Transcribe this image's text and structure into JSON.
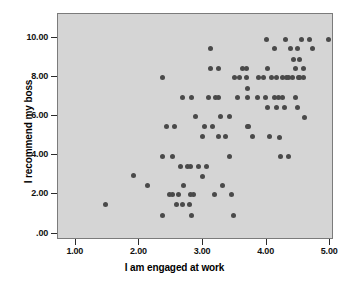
{
  "chart_data": {
    "type": "scatter",
    "title": "",
    "xlabel": "I am engaged at work",
    "ylabel": "I recommend my boss",
    "xlim": [
      0.72,
      5.06
    ],
    "ylim": [
      -0.32,
      11.2
    ],
    "grid": false,
    "legend": "none",
    "xticks": [
      "1.00",
      "2.00",
      "3.00",
      "4.00",
      "5.00"
    ],
    "xtick_values": [
      1.0,
      2.0,
      3.0,
      4.0,
      5.0
    ],
    "yticks": [
      "10.00",
      "8.00",
      "6.00",
      "4.00",
      "2.00",
      ".00"
    ],
    "ytick_values": [
      10.0,
      8.0,
      6.0,
      4.0,
      2.0,
      0.0
    ],
    "marker": "circle",
    "marker_color": "#4a4a4a",
    "plot_background": "#d5d5d5",
    "figure_background": "#ffffff",
    "n_points": 97,
    "points": [
      [
        1.47,
        1.5
      ],
      [
        1.9,
        2.95
      ],
      [
        2.12,
        2.45
      ],
      [
        2.37,
        7.95
      ],
      [
        2.37,
        3.95
      ],
      [
        2.37,
        0.95
      ],
      [
        2.42,
        5.45
      ],
      [
        2.52,
        3.95
      ],
      [
        2.52,
        1.98
      ],
      [
        2.55,
        5.45
      ],
      [
        2.62,
        1.98
      ],
      [
        2.65,
        3.45
      ],
      [
        2.67,
        6.95
      ],
      [
        2.68,
        1.47
      ],
      [
        2.7,
        2.45
      ],
      [
        2.75,
        3.45
      ],
      [
        2.78,
        1.47
      ],
      [
        2.8,
        3.45
      ],
      [
        2.8,
        1.98
      ],
      [
        2.82,
        6.95
      ],
      [
        2.82,
        0.95
      ],
      [
        2.88,
        5.95
      ],
      [
        3.0,
        4.95
      ],
      [
        3.02,
        5.45
      ],
      [
        3.0,
        2.93
      ],
      [
        3.05,
        3.45
      ],
      [
        3.12,
        9.45
      ],
      [
        3.12,
        8.4
      ],
      [
        3.15,
        5.45
      ],
      [
        3.18,
        1.98
      ],
      [
        3.25,
        8.4
      ],
      [
        3.25,
        6.95
      ],
      [
        3.25,
        4.95
      ],
      [
        3.28,
        5.95
      ],
      [
        3.3,
        2.45
      ],
      [
        3.42,
        5.95
      ],
      [
        3.42,
        3.95
      ],
      [
        3.45,
        1.98
      ],
      [
        3.48,
        0.95
      ],
      [
        3.5,
        7.95
      ],
      [
        3.55,
        6.95
      ],
      [
        3.68,
        8.4
      ],
      [
        3.68,
        7.95
      ],
      [
        3.7,
        7.42
      ],
      [
        3.7,
        6.95
      ],
      [
        3.7,
        5.45
      ],
      [
        3.72,
        5.45
      ],
      [
        3.78,
        4.95
      ],
      [
        3.95,
        7.95
      ],
      [
        3.98,
        6.95
      ],
      [
        4.0,
        9.9
      ],
      [
        4.02,
        8.4
      ],
      [
        4.02,
        6.45
      ],
      [
        4.05,
        4.95
      ],
      [
        4.12,
        9.42
      ],
      [
        4.15,
        7.95
      ],
      [
        4.18,
        6.95
      ],
      [
        4.2,
        4.9
      ],
      [
        4.22,
        3.92
      ],
      [
        4.25,
        7.95
      ],
      [
        4.25,
        6.95
      ],
      [
        4.28,
        6.45
      ],
      [
        4.3,
        9.9
      ],
      [
        4.32,
        7.95
      ],
      [
        4.35,
        3.92
      ],
      [
        4.38,
        9.42
      ],
      [
        4.4,
        7.95
      ],
      [
        4.42,
        8.88
      ],
      [
        4.45,
        8.4
      ],
      [
        4.45,
        6.95
      ],
      [
        4.48,
        6.45
      ],
      [
        4.5,
        7.95
      ],
      [
        4.52,
        8.88
      ],
      [
        4.55,
        9.9
      ],
      [
        4.58,
        8.4
      ],
      [
        4.58,
        7.95
      ],
      [
        4.6,
        5.92
      ],
      [
        4.68,
        9.9
      ],
      [
        4.72,
        9.42
      ],
      [
        4.98,
        9.9
      ],
      [
        2.48,
        1.98
      ],
      [
        2.85,
        1.98
      ],
      [
        3.08,
        6.95
      ],
      [
        3.35,
        4.95
      ],
      [
        3.58,
        7.95
      ],
      [
        3.62,
        8.4
      ],
      [
        3.85,
        6.95
      ],
      [
        3.88,
        7.95
      ],
      [
        4.08,
        7.95
      ],
      [
        4.12,
        6.95
      ],
      [
        4.15,
        6.45
      ],
      [
        4.35,
        7.95
      ],
      [
        4.48,
        9.42
      ],
      [
        4.52,
        7.95
      ],
      [
        2.93,
        3.45
      ],
      [
        3.2,
        6.95
      ],
      [
        2.58,
        1.47
      ]
    ]
  }
}
